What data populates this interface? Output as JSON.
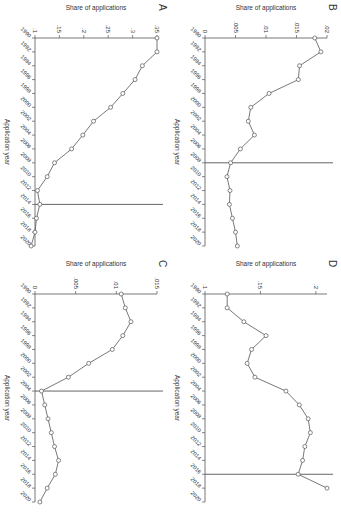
{
  "chart_data": [
    {
      "panel": "A",
      "type": "line",
      "xlabel": "Application year",
      "ylabel": "Share of applications",
      "x": [
        1990,
        1992,
        1994,
        1996,
        1998,
        2000,
        2002,
        2004,
        2006,
        2008,
        2010,
        2012,
        2014,
        2016,
        2018,
        2020
      ],
      "values": [
        0.35,
        0.35,
        0.32,
        0.305,
        0.28,
        0.255,
        0.22,
        0.198,
        0.175,
        0.14,
        0.125,
        0.105,
        0.11,
        0.103,
        0.1,
        0.092
      ],
      "yticks": [
        0.1,
        0.15,
        0.2,
        0.25,
        0.3,
        0.35
      ],
      "ytick_labels": [
        ".1",
        ".15",
        ".2",
        ".25",
        ".3",
        ".35"
      ],
      "ylim": [
        0.1,
        0.35
      ],
      "vline_x": 2014
    },
    {
      "panel": "B",
      "type": "line",
      "xlabel": "Application year",
      "ylabel": "Share of applications",
      "x": [
        1990,
        1992,
        1994,
        1996,
        1998,
        2000,
        2002,
        2004,
        2006,
        2008,
        2010,
        2012,
        2014,
        2016,
        2018,
        2020
      ],
      "values": [
        0.018,
        0.019,
        0.0155,
        0.0153,
        0.0105,
        0.0075,
        0.0071,
        0.0081,
        0.0058,
        0.0042,
        0.0036,
        0.0041,
        0.004,
        0.0045,
        0.005,
        0.0053
      ],
      "yticks": [
        0,
        0.005,
        0.01,
        0.015,
        0.02
      ],
      "ytick_labels": [
        "0",
        ".005",
        ".01",
        ".015",
        ".02"
      ],
      "ylim": [
        0,
        0.02
      ],
      "vline_x": 2008
    },
    {
      "panel": "C",
      "type": "line",
      "xlabel": "Application year",
      "ylabel": "Share of applications",
      "x": [
        1990,
        1992,
        1994,
        1996,
        1998,
        2000,
        2002,
        2004,
        2006,
        2008,
        2010,
        2012,
        2014,
        2016,
        2018,
        2020
      ],
      "values": [
        0.0106,
        0.0111,
        0.0118,
        0.0108,
        0.0095,
        0.0066,
        0.0041,
        0.0008,
        0.0012,
        0.0016,
        0.002,
        0.0024,
        0.0029,
        0.0025,
        0.0015,
        0.0006
      ],
      "yticks": [
        0,
        0.005,
        0.01,
        0.015
      ],
      "ytick_labels": [
        "0",
        ".005",
        ".01",
        ".015"
      ],
      "ylim": [
        0,
        0.015
      ],
      "vline_x": 2004
    },
    {
      "panel": "D",
      "type": "line",
      "xlabel": "Application year",
      "ylabel": "Share of applications",
      "x": [
        1990,
        1992,
        1994,
        1996,
        1998,
        2000,
        2002,
        2004,
        2006,
        2008,
        2010,
        2012,
        2014,
        2016,
        2018
      ],
      "values": [
        0.12,
        0.12,
        0.135,
        0.155,
        0.142,
        0.138,
        0.145,
        0.173,
        0.185,
        0.193,
        0.195,
        0.19,
        0.188,
        0.184,
        0.21
      ],
      "yticks": [
        0.1,
        0.15,
        0.2
      ],
      "ytick_labels": [
        ".1",
        ".15",
        ".2"
      ],
      "ylim": [
        0.1,
        0.21
      ],
      "vline_x": 2016
    }
  ]
}
